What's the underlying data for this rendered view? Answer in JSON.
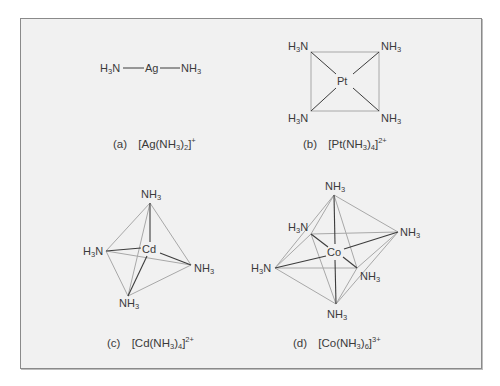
{
  "figure": {
    "panels": [
      {
        "id": "a",
        "label": "(a)",
        "formula": "[Ag(NH3)2]+",
        "formula_parts": {
          "prefix": "[Ag(NH",
          "sub1": "3",
          "mid": ")",
          "sub2": "2",
          "close": "]",
          "charge": "+"
        },
        "geometry": "linear",
        "metal": "Ag",
        "ligands": [
          "H3N",
          "NH3"
        ]
      },
      {
        "id": "b",
        "label": "(b)",
        "formula": "[Pt(NH3)4]2+",
        "formula_parts": {
          "prefix": "[Pt(NH",
          "sub1": "3",
          "mid": ")",
          "sub2": "4",
          "close": "]",
          "charge": "2+"
        },
        "geometry": "square planar",
        "metal": "Pt",
        "ligands": [
          "H3N",
          "NH3",
          "H3N",
          "NH3"
        ]
      },
      {
        "id": "c",
        "label": "(c)",
        "formula": "[Cd(NH3)4]2+",
        "formula_parts": {
          "prefix": "[Cd(NH",
          "sub1": "3",
          "mid": ")",
          "sub2": "4",
          "close": "]",
          "charge": "2+"
        },
        "geometry": "tetrahedral",
        "metal": "Cd",
        "ligands": [
          "NH3",
          "H3N",
          "NH3",
          "NH3"
        ]
      },
      {
        "id": "d",
        "label": "(d)",
        "formula": "[Co(NH3)6]3+",
        "formula_parts": {
          "prefix": "[Co(NH",
          "sub1": "3",
          "mid": ")",
          "sub2": "6",
          "close": "]",
          "charge": "3+"
        },
        "geometry": "octahedral",
        "metal": "Co",
        "ligands": [
          "NH3",
          "H3N",
          "NH3",
          "H3N",
          "NH3",
          "NH3"
        ]
      }
    ],
    "labels": {
      "h3n": "H",
      "h3n_sub": "3",
      "h3n_tail": "N",
      "nh3": "NH",
      "nh3_sub": "3"
    },
    "colors": {
      "background": "#f1f1f1",
      "frame_border": "#8a8a8a",
      "bond_dark": "#3c3c3c",
      "edge_light": "#a8a8a8",
      "text": "#3a3a3a"
    }
  }
}
